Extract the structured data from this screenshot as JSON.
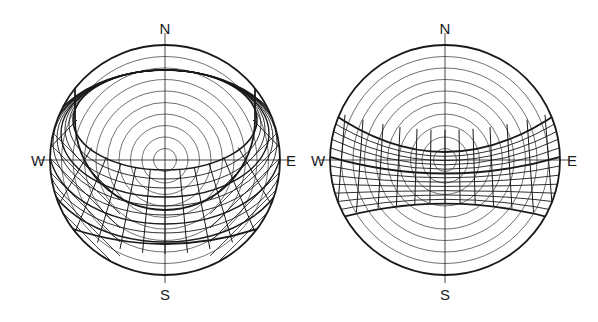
{
  "diagrams": [
    {
      "id": "left",
      "center": [
        165,
        160
      ],
      "radius": 115,
      "labels": {
        "north": "N",
        "south": "S",
        "west": "W",
        "east": "E"
      },
      "rings": 9,
      "band": "sun-path band covering southern sky (crescent)"
    },
    {
      "id": "right",
      "center": [
        445,
        160
      ],
      "radius": 115,
      "labels": {
        "north": "N",
        "south": "S",
        "west": "W",
        "east": "E"
      },
      "rings": 9,
      "band": "sun-path band across the zenith (equatorial)"
    }
  ],
  "colors": {
    "line": "#1a1a1a",
    "thin": "#333333",
    "background": "#ffffff"
  }
}
